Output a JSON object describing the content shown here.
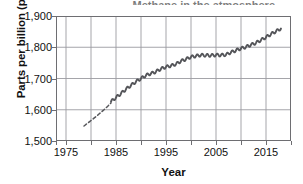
{
  "figure": {
    "title_partial": "Methane in the atmosphere",
    "line_color": "#55565a",
    "grid_color": "#9b9ba0",
    "frame_color": "#6e6e72",
    "text_color": "#111111"
  },
  "chart_data": {
    "type": "line",
    "title": "",
    "xlabel": "Year",
    "ylabel": "Parts per billion (ppb)",
    "xlim": [
      1973,
      2020
    ],
    "ylim": [
      1500,
      1900
    ],
    "grid": true,
    "legend": "none",
    "x_major_ticks": [
      1975,
      1985,
      1995,
      2005,
      2015
    ],
    "x_minor_ticks": [
      1980,
      1990,
      2000,
      2010
    ],
    "x_tick_labels": [
      "1975",
      "1985",
      "1995",
      "2005",
      "2015"
    ],
    "y_ticks": [
      1500,
      1600,
      1700,
      1800,
      1900
    ],
    "y_tick_labels": [
      "1,500",
      "1,600",
      "1,700",
      "1,800",
      "1,900"
    ],
    "series": [
      {
        "name": "Ice core / early record (dashed)",
        "style": "dashed",
        "x": [
          1978.6,
          1979.4,
          1980.2,
          1981.0,
          1981.8,
          1982.6,
          1983.4,
          1984.0
        ],
        "values": [
          1548,
          1558,
          1568,
          1578,
          1589,
          1600,
          1612,
          1622
        ]
      },
      {
        "name": "Direct atmospheric measurements (solid)",
        "style": "solid",
        "x": [
          1984,
          1985,
          1986,
          1987,
          1988,
          1989,
          1990,
          1991,
          1992,
          1993,
          1994,
          1995,
          1996,
          1997,
          1998,
          1999,
          2000,
          2001,
          2002,
          2003,
          2004,
          2005,
          2006,
          2007,
          2008,
          2009,
          2010,
          2011,
          2012,
          2013,
          2014,
          2015,
          2016,
          2017,
          2018
        ],
        "values": [
          1626,
          1639,
          1652,
          1666,
          1678,
          1690,
          1700,
          1710,
          1716,
          1722,
          1731,
          1737,
          1741,
          1746,
          1756,
          1762,
          1769,
          1772,
          1775,
          1774,
          1774,
          1775,
          1775,
          1776,
          1784,
          1790,
          1796,
          1801,
          1808,
          1814,
          1823,
          1832,
          1842,
          1851,
          1860
        ]
      }
    ]
  }
}
